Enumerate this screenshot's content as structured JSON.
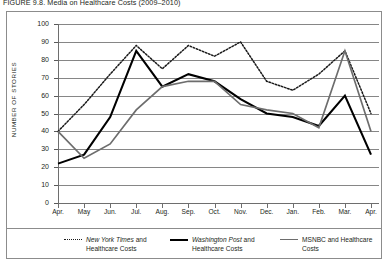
{
  "caption": "FIGURE 9.8. Media on Healthcare Costs (2009–2010)",
  "axes": {
    "y_title": "NUMBER OF  STORIES",
    "y_ticks": [
      "100",
      "90",
      "80",
      "70",
      "60",
      "50",
      "40",
      "30",
      "20",
      "10",
      "0"
    ],
    "x_ticks": [
      "Apr.",
      "May",
      "Jun.",
      "Jul.",
      "Aug.",
      "Sep.",
      "Oct.",
      "Nov.",
      "Dec.",
      "Jan.",
      "Feb.",
      "Mar.",
      "Apr."
    ]
  },
  "legend": {
    "entries": [
      {
        "style": "dotted",
        "name": "New York Times",
        "rest": " and",
        "line2": "Healthcare Costs",
        "color": "#1a1a1a"
      },
      {
        "style": "solid-black",
        "name": "Washington Post",
        "rest": " and",
        "line2": "Healthcare Costs",
        "color": "#000000"
      },
      {
        "style": "solid-gray",
        "name": "",
        "rest": "MSNBC and Healthcare",
        "line2": "Costs",
        "color": "#6d6d6d"
      }
    ]
  },
  "colors": {
    "grid": "#868686",
    "axis": "#6e6e6e",
    "frame": "#8c8c8c",
    "nyt": "#1a1a1a",
    "wapo": "#000000",
    "msnbc": "#6d6d6d",
    "text": "#231f20"
  },
  "chart_data": {
    "type": "line",
    "title": "FIGURE 9.8. Media on Healthcare Costs (2009–2010)",
    "xlabel": "",
    "ylabel": "NUMBER OF STORIES",
    "ylim": [
      0,
      100
    ],
    "ytick_step": 10,
    "grid": true,
    "legend_position": "bottom",
    "categories": [
      "Apr.",
      "May",
      "Jun.",
      "Jul.",
      "Aug.",
      "Sep.",
      "Oct.",
      "Nov.",
      "Dec.",
      "Jan.",
      "Feb.",
      "Mar.",
      "Apr."
    ],
    "series": [
      {
        "name": "New York Times and Healthcare Costs",
        "style": "dotted",
        "color": "#1a1a1a",
        "values": [
          40,
          55,
          72,
          88,
          75,
          88,
          82,
          90,
          68,
          63,
          72,
          85,
          50
        ]
      },
      {
        "name": "Washington Post and Healthcare Costs",
        "style": "solid-thick",
        "color": "#000000",
        "values": [
          22,
          27,
          48,
          85,
          65,
          72,
          68,
          58,
          50,
          48,
          43,
          60,
          27
        ]
      },
      {
        "name": "MSNBC and Healthcare Costs",
        "style": "solid",
        "color": "#6d6d6d",
        "values": [
          40,
          25,
          33,
          52,
          65,
          68,
          68,
          55,
          52,
          50,
          42,
          85,
          40
        ]
      }
    ]
  }
}
